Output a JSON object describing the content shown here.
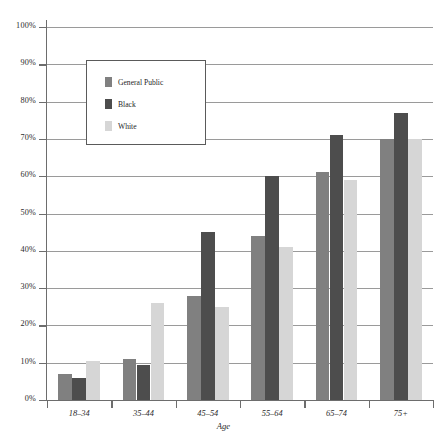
{
  "chart_data": {
    "type": "bar",
    "title": "",
    "subtitle": "",
    "xlabel": "Age",
    "ylabel": "",
    "categories": [
      "18–34",
      "35–44",
      "45–54",
      "55–64",
      "65–74",
      "75+"
    ],
    "series": [
      {
        "name": "General Public",
        "color": "#808080",
        "values": [
          7,
          11,
          28,
          44,
          61,
          70
        ]
      },
      {
        "name": "Black",
        "color": "#4d4d4d",
        "values": [
          6,
          9.5,
          45,
          60,
          71,
          77
        ]
      },
      {
        "name": "White",
        "color": "#d6d6d6",
        "values": [
          10.5,
          26,
          25,
          41,
          59,
          70
        ]
      }
    ],
    "ylim": [
      0,
      100
    ],
    "yticks": [
      0,
      10,
      20,
      30,
      40,
      50,
      60,
      70,
      80,
      90,
      100
    ],
    "ytick_labels": [
      "0%",
      "10%",
      "20%",
      "30%",
      "40%",
      "50%",
      "60%",
      "70%",
      "80%",
      "90%",
      "100%"
    ],
    "grid": true,
    "grid_axis": "y",
    "legend_position": "upper-left-inside",
    "legend_entries": [
      "General Public",
      "Black",
      "White"
    ]
  },
  "axis": {
    "x_title": "Age"
  },
  "legend": {
    "items": [
      {
        "label": "General Public"
      },
      {
        "label": "Black"
      },
      {
        "label": "White"
      }
    ]
  }
}
